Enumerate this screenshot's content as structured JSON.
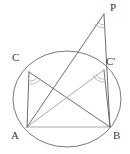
{
  "figure": {
    "background_color": "#ffffff",
    "line_color": "#5d5d5d",
    "light_line_color": "#9a9a9a",
    "arc_color": "#9d9d9d",
    "labels": [
      {
        "id": "P",
        "text": "P",
        "x": 110,
        "y": 2,
        "point_x": 104,
        "point_y": 14
      },
      {
        "id": "C",
        "text": "C",
        "x": 12,
        "y": 52,
        "point_x": 29,
        "point_y": 72
      },
      {
        "id": "Cp",
        "text": "C'",
        "x": 106,
        "y": 56,
        "point_x": 104,
        "point_y": 70
      },
      {
        "id": "A",
        "text": "A",
        "x": 11,
        "y": 130,
        "point_x": 27,
        "point_y": 127
      },
      {
        "id": "B",
        "text": "B",
        "x": 113,
        "y": 130,
        "point_x": 110,
        "point_y": 127
      }
    ],
    "circle": {
      "center_x": 67,
      "center_y": 99,
      "radius_x": 54,
      "radius_y": 48
    },
    "segments": [
      {
        "id": "AB",
        "from": "A",
        "to": "B",
        "weight": "light"
      },
      {
        "id": "AC",
        "from": "A",
        "to": "C",
        "weight": "main"
      },
      {
        "id": "CB",
        "from": "C",
        "to": "B",
        "weight": "main"
      },
      {
        "id": "ACp",
        "from": "A",
        "to": "Cp",
        "weight": "light"
      },
      {
        "id": "CpB",
        "from": "Cp",
        "to": "B",
        "weight": "main"
      },
      {
        "id": "AP",
        "from": "A",
        "to": "P",
        "weight": "main"
      },
      {
        "id": "PB",
        "from": "P",
        "to": "B",
        "weight": "main"
      }
    ],
    "angle_arcs": [
      {
        "id": "angle-at-C",
        "vertex": "C",
        "radius": 9
      },
      {
        "id": "angle-at-Cp",
        "vertex": "Cp",
        "radius": 9
      },
      {
        "id": "angle-at-P",
        "vertex": "P",
        "radius": 11
      }
    ]
  }
}
